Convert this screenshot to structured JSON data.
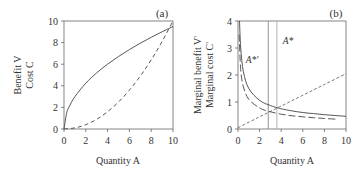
{
  "chart_data": [
    {
      "panel": "(a)",
      "type": "line",
      "title": "",
      "xlabel": "Quantity A",
      "ylabel_lines": [
        "Benefit V",
        "Cost C"
      ],
      "xlim": [
        0,
        10
      ],
      "ylim": [
        0,
        10
      ],
      "xticks": [
        0,
        2,
        4,
        6,
        8,
        10
      ],
      "yticks": [
        0,
        2,
        4,
        6,
        8,
        10
      ],
      "grid": false,
      "series": [
        {
          "name": "Benefit V",
          "style": "solid",
          "x": [
            0,
            0.25,
            0.5,
            1,
            2,
            3,
            4,
            5,
            6,
            7,
            8,
            9,
            10
          ],
          "values": [
            0,
            1.5,
            2.12,
            3.0,
            4.24,
            5.2,
            6.0,
            6.71,
            7.35,
            7.94,
            8.49,
            9.0,
            9.49
          ]
        },
        {
          "name": "Cost C",
          "style": "dashed",
          "x": [
            0,
            1,
            2,
            3,
            4,
            5,
            6,
            7,
            8,
            9,
            10
          ],
          "values": [
            0,
            0.1,
            0.4,
            0.9,
            1.6,
            2.5,
            3.6,
            4.9,
            6.4,
            8.1,
            10.0
          ]
        }
      ]
    },
    {
      "panel": "(b)",
      "type": "line",
      "title": "",
      "xlabel": "Quantity A",
      "ylabel_lines": [
        "Marginal benefit V'",
        "Marginal cost C'"
      ],
      "xlim": [
        0,
        10
      ],
      "ylim": [
        0,
        4
      ],
      "xticks": [
        0,
        2,
        4,
        6,
        8,
        10
      ],
      "yticks": [
        0,
        1,
        2,
        3,
        4
      ],
      "grid": false,
      "series": [
        {
          "name": "Marginal benefit V'",
          "style": "solid",
          "x": [
            0.14,
            0.25,
            0.5,
            1,
            2,
            3,
            3.6,
            4,
            5,
            6,
            7,
            8,
            9,
            10
          ],
          "values": [
            4.0,
            3.0,
            2.12,
            1.5,
            1.06,
            0.87,
            0.79,
            0.75,
            0.67,
            0.61,
            0.57,
            0.53,
            0.5,
            0.47
          ]
        },
        {
          "name": "Marginal benefit V' (alternative)",
          "style": "long-dashed",
          "x": [
            0.1,
            0.25,
            0.5,
            1,
            2,
            2.8,
            4,
            5,
            6,
            7,
            8,
            9.2
          ],
          "values": [
            3.5,
            2.2,
            1.56,
            1.1,
            0.78,
            0.66,
            0.55,
            0.49,
            0.45,
            0.42,
            0.39,
            0.36
          ]
        },
        {
          "name": "Marginal cost C'",
          "style": "dashed",
          "x": [
            0,
            2,
            4,
            6,
            8,
            10
          ],
          "values": [
            0.05,
            0.45,
            0.85,
            1.25,
            1.65,
            2.05
          ]
        }
      ],
      "annotations": [
        {
          "label": "A*'",
          "x": 2.8,
          "type": "vline",
          "text_pos": [
            1.5,
            2.6
          ]
        },
        {
          "label": "A*",
          "x": 3.6,
          "type": "vline",
          "text_pos": [
            4.2,
            3.3
          ]
        }
      ]
    }
  ],
  "labels": {
    "panel_a": "(a)",
    "panel_b": "(b)",
    "xlabel_a": "Quantity A",
    "xlabel_b": "Quantity A",
    "ylabel_a_1": "Benefit V",
    "ylabel_a_2": "Cost C",
    "ylabel_b_1": "Marginal benefit V'",
    "ylabel_b_2": "Marginal cost C'",
    "astar": "A*",
    "astar_prime": "A*'"
  }
}
